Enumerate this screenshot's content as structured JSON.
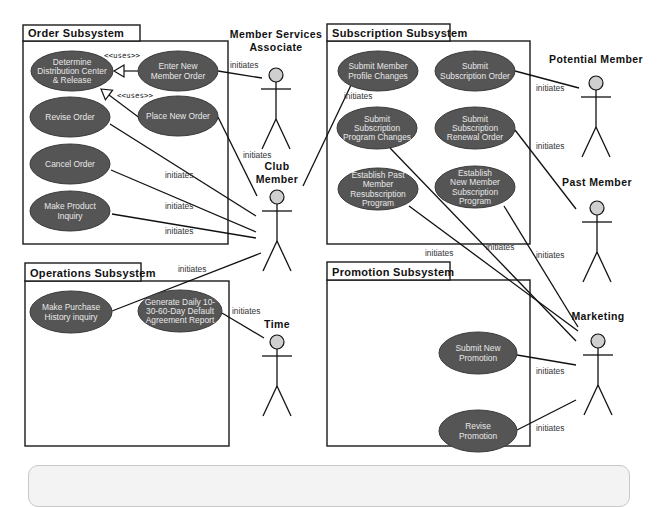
{
  "diagram": {
    "type": "uml-use-case",
    "colors": {
      "usecase_fill": "#555555",
      "usecase_text": "#e8e8e8",
      "actor_head": "#cfcfcf",
      "line": "#111111",
      "caption_bg": "#f3f3f3"
    },
    "frames": [
      {
        "id": "order",
        "title": "Order Subsystem",
        "tab": [
          23,
          25,
          117,
          16
        ],
        "box": [
          23,
          41,
          205,
          203
        ]
      },
      {
        "id": "operations",
        "title": "Operations Subsystem",
        "tab": [
          25,
          263,
          116,
          18
        ],
        "box": [
          25,
          281,
          204,
          165
        ]
      },
      {
        "id": "subscription",
        "title": "Subscription Subsystem",
        "tab": [
          327,
          24,
          123,
          17
        ],
        "box": [
          327,
          41,
          203,
          203
        ]
      },
      {
        "id": "promotion",
        "title": "Promotion Subsystem",
        "tab": [
          327,
          262,
          123,
          18
        ],
        "box": [
          327,
          280,
          203,
          166
        ]
      }
    ],
    "use_cases": [
      {
        "id": "determine",
        "lines": [
          "Determine",
          "Distribution Center",
          "& Release"
        ],
        "cx": 72,
        "cy": 71,
        "rx": 41,
        "ry": 20
      },
      {
        "id": "enter-new",
        "lines": [
          "Enter New",
          "Member Order"
        ],
        "cx": 178,
        "cy": 71,
        "rx": 40,
        "ry": 20
      },
      {
        "id": "revise-order",
        "lines": [
          "Revise Order"
        ],
        "cx": 70,
        "cy": 117,
        "rx": 40,
        "ry": 20
      },
      {
        "id": "place-new",
        "lines": [
          "Place New Order"
        ],
        "cx": 178,
        "cy": 116,
        "rx": 40,
        "ry": 20
      },
      {
        "id": "cancel-order",
        "lines": [
          "Cancel Order"
        ],
        "cx": 70,
        "cy": 164,
        "rx": 40,
        "ry": 20
      },
      {
        "id": "product-inquiry",
        "lines": [
          "Make Product",
          "Inquiry"
        ],
        "cx": 70,
        "cy": 211,
        "rx": 40,
        "ry": 20
      },
      {
        "id": "purchase-history",
        "lines": [
          "Make Purchase",
          "History inquiry"
        ],
        "cx": 71,
        "cy": 312,
        "rx": 41,
        "ry": 21
      },
      {
        "id": "generate-report",
        "lines": [
          "Generate Daily 10-",
          "30-60-Day Default",
          "Agreement Report"
        ],
        "cx": 180,
        "cy": 311,
        "rx": 42,
        "ry": 21
      },
      {
        "id": "profile-changes",
        "lines": [
          "Submit Member",
          "Profile Changes"
        ],
        "cx": 378,
        "cy": 71,
        "rx": 40,
        "ry": 20
      },
      {
        "id": "subscription-order",
        "lines": [
          "Submit",
          "Subscription Order"
        ],
        "cx": 475,
        "cy": 71,
        "rx": 40,
        "ry": 20
      },
      {
        "id": "program-changes",
        "lines": [
          "Submit",
          "Subscription",
          "Program Changes"
        ],
        "cx": 377,
        "cy": 128,
        "rx": 40,
        "ry": 21
      },
      {
        "id": "renewal-order",
        "lines": [
          "Submit",
          "Subscription",
          "Renewal Order"
        ],
        "cx": 475,
        "cy": 128,
        "rx": 40,
        "ry": 21
      },
      {
        "id": "past-resub",
        "lines": [
          "Establish Past",
          "Member",
          "Resubscription",
          "Program"
        ],
        "cx": 378,
        "cy": 189,
        "rx": 40,
        "ry": 21
      },
      {
        "id": "new-member-program",
        "lines": [
          "Establish",
          "New Member",
          "Subscription",
          "Program"
        ],
        "cx": 475,
        "cy": 187,
        "rx": 40,
        "ry": 21
      },
      {
        "id": "new-promotion",
        "lines": [
          "Submit New",
          "Promotion"
        ],
        "cx": 478,
        "cy": 353,
        "rx": 39,
        "ry": 21
      },
      {
        "id": "revise-promotion",
        "lines": [
          "Revise",
          "Promotion"
        ],
        "cx": 478,
        "cy": 431,
        "rx": 39,
        "ry": 21
      }
    ],
    "actors": [
      {
        "id": "msa",
        "name_lines": [
          "Member Services",
          "Associate"
        ],
        "x": 276,
        "head_y": 75,
        "name_y": 38
      },
      {
        "id": "club-member",
        "name_lines": [
          "Club",
          "Member"
        ],
        "x": 277,
        "head_y": 197,
        "name_y": 170
      },
      {
        "id": "time",
        "name_lines": [
          "Time"
        ],
        "x": 277,
        "head_y": 342,
        "name_y": 328
      },
      {
        "id": "potential-member",
        "name_lines": [
          "Potential Member"
        ],
        "x": 596,
        "head_y": 83,
        "name_y": 63
      },
      {
        "id": "past-member",
        "name_lines": [
          "Past Member"
        ],
        "x": 597,
        "head_y": 208,
        "name_y": 186
      },
      {
        "id": "marketing",
        "name_lines": [
          "Marketing"
        ],
        "x": 598,
        "head_y": 341,
        "name_y": 320
      }
    ],
    "uses_relations": [
      {
        "label": "<<uses>>",
        "from": [
          138,
          71
        ],
        "to": [
          114,
          71
        ],
        "label_pos": [
          104,
          58
        ]
      },
      {
        "label": "<<uses>>",
        "from": [
          161,
          134
        ],
        "to": [
          101,
          89
        ],
        "label_pos": [
          117,
          98
        ]
      }
    ],
    "associations": [
      {
        "from": [
          218,
          71
        ],
        "to": [
          262,
          78
        ],
        "label": "initiates",
        "label_pos": [
          230,
          68
        ]
      },
      {
        "from": [
          218,
          117
        ],
        "to": [
          257,
          196
        ],
        "label": "initiates",
        "label_pos": [
          243,
          158
        ]
      },
      {
        "from": [
          110,
          124
        ],
        "to": [
          256,
          216
        ],
        "label": "initiates",
        "label_pos": [
          165,
          178
        ]
      },
      {
        "from": [
          111,
          170
        ],
        "to": [
          256,
          232
        ],
        "label": "initiates",
        "label_pos": [
          165,
          209
        ]
      },
      {
        "from": [
          112,
          214
        ],
        "to": [
          256,
          238
        ],
        "label": "initiates",
        "label_pos": [
          165,
          234
        ]
      },
      {
        "from": [
          112,
          311
        ],
        "to": [
          261,
          253
        ],
        "label": "initiates",
        "label_pos": [
          178,
          272
        ]
      },
      {
        "from": [
          222,
          313
        ],
        "to": [
          264,
          338
        ],
        "label": "initiates",
        "label_pos": [
          232,
          314
        ]
      },
      {
        "from": [
          352,
          83
        ],
        "to": [
          303,
          186
        ],
        "label": "initiates",
        "label_pos": [
          344,
          99
        ]
      },
      {
        "from": [
          515,
          71
        ],
        "to": [
          579,
          88
        ],
        "label": "initiates",
        "label_pos": [
          536,
          91
        ]
      },
      {
        "from": [
          515,
          130
        ],
        "to": [
          576,
          209
        ],
        "label": "initiates",
        "label_pos": [
          536,
          149
        ]
      },
      {
        "from": [
          409,
          206
        ],
        "to": [
          578,
          331
        ],
        "label": "initiates",
        "label_pos": [
          425,
          256
        ]
      },
      {
        "from": [
          390,
          148
        ],
        "to": [
          576,
          341
        ],
        "label": "initiates",
        "label_pos": [
          486,
          250
        ]
      },
      {
        "from": [
          504,
          206
        ],
        "to": [
          578,
          327
        ],
        "label": "initiates",
        "label_pos": [
          536,
          258
        ]
      },
      {
        "from": [
          517,
          355
        ],
        "to": [
          576,
          365
        ],
        "label": "initiates",
        "label_pos": [
          536,
          374
        ]
      },
      {
        "from": [
          517,
          430
        ],
        "to": [
          576,
          400
        ],
        "label": "initiates",
        "label_pos": [
          536,
          431
        ]
      }
    ]
  },
  "caption_box": {
    "visible": true
  }
}
